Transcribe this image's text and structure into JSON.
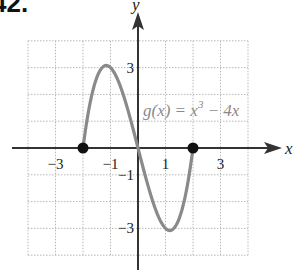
{
  "problem": {
    "number": "42."
  },
  "chart_data": {
    "type": "line",
    "title": "",
    "function_label": "g(x) = x^3 − 4x",
    "label_parts": {
      "prefix": "g(x) = x",
      "exponent": "3",
      "suffix": " − 4x"
    },
    "xlabel": "x",
    "ylabel": "y",
    "xlim": [
      -4,
      4
    ],
    "ylim": [
      -4,
      4
    ],
    "grid": true,
    "x_ticks": [
      {
        "value": -3,
        "label": "−3"
      },
      {
        "value": -1,
        "label": "−1"
      },
      {
        "value": 1,
        "label": "1"
      },
      {
        "value": 3,
        "label": "3"
      }
    ],
    "y_ticks": [
      {
        "value": 3,
        "label": "3"
      },
      {
        "value": -1,
        "label": "−1"
      },
      {
        "value": -3,
        "label": "−3"
      }
    ],
    "series": [
      {
        "name": "g(x) = x^3 − 4x",
        "domain": [
          -2,
          2
        ],
        "x": [
          -2,
          -1.5,
          -1.1547,
          -1,
          -0.5,
          0,
          0.5,
          1,
          1.1547,
          1.5,
          2
        ],
        "y": [
          0,
          2.625,
          3.079,
          3,
          1.875,
          0,
          -1.875,
          -3,
          -3.079,
          -2.625,
          0
        ],
        "color": "#8a8a8a"
      }
    ],
    "points": [
      {
        "x": -2,
        "y": 0,
        "style": "closed"
      },
      {
        "x": 2,
        "y": 0,
        "style": "closed"
      }
    ]
  },
  "colors": {
    "curve": "#8a8a8a",
    "axis": "#333333",
    "grid": "#b8b8b8",
    "point": "#111111"
  }
}
